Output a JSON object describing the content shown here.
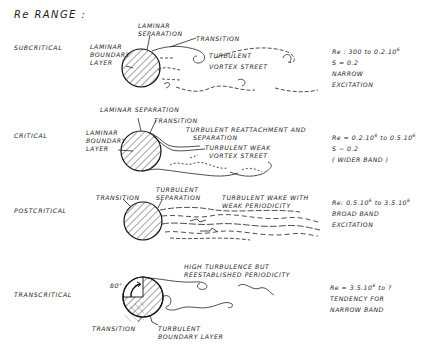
{
  "title": "Re RANGE :",
  "rows": [
    {
      "regime": "SUBCRITICAL",
      "labels": {
        "boundary_layer": [
          "LAMINAR",
          "BOUNDARY",
          "LAYER"
        ],
        "separation": [
          "LAMINAR",
          "SEPARATION"
        ],
        "transition": "TRANSITION",
        "wake": [
          "TURBULENT",
          "VORTEX STREET"
        ]
      },
      "params": {
        "re_prefix": "Re : 300 to 0.2.10",
        "re_exp": "6",
        "re_suffix": "",
        "lines": [
          "S ≈ 0.2",
          "NARROW",
          "EXCITATION"
        ]
      }
    },
    {
      "regime": "CRITICAL",
      "labels": {
        "separation": "LAMINAR SEPARATION",
        "transition": "TRANSITION",
        "boundary_layer": [
          "LAMINAR",
          "BOUNDARY",
          "LAYER"
        ],
        "reattachment": [
          "TURBULENT REATTACHMENT AND",
          "SEPARATION"
        ],
        "wake": [
          "TURBULENT WEAK",
          "VORTEX STREET"
        ]
      },
      "params": {
        "re_prefix": "Re ≈ 0.2.10",
        "re_exp": "6",
        "re_mid": " to 0.5.10",
        "re_exp2": "6",
        "lines": [
          "S ~ 0.2",
          "( WIDER BAND )"
        ]
      }
    },
    {
      "regime": "POSTCRITICAL",
      "labels": {
        "transition": "TRANSITION",
        "separation": [
          "TURBULENT",
          "SEPARATION"
        ],
        "wake": [
          "TURBULENT WAKE WITH",
          "WEAK PERIODICITY"
        ]
      },
      "params": {
        "re_prefix": "Re: 0.5.10",
        "re_exp": "6",
        "re_mid": " to 3.5.10",
        "re_exp2": "6",
        "lines": [
          "BROAD BAND",
          "EXCITATION"
        ]
      }
    },
    {
      "regime": "TRANSCRITICAL",
      "labels": {
        "angle": "80°",
        "transition": "TRANSITION",
        "boundary_layer": [
          "TURBULENT",
          "BOUNDARY LAYER"
        ],
        "wake": [
          "HIGH TURBULENCE BUT",
          "REESTABLISHED PERIODICITY"
        ]
      },
      "params": {
        "re_prefix": "Re ≈ 3.5.10",
        "re_exp": "6",
        "re_mid": " to ?",
        "lines": [
          "TENDENCY FOR",
          "NARROW BAND"
        ]
      }
    }
  ],
  "icons": {
    "cylinder": "hatched-circle",
    "wake": "dashed-vortex-lines"
  }
}
